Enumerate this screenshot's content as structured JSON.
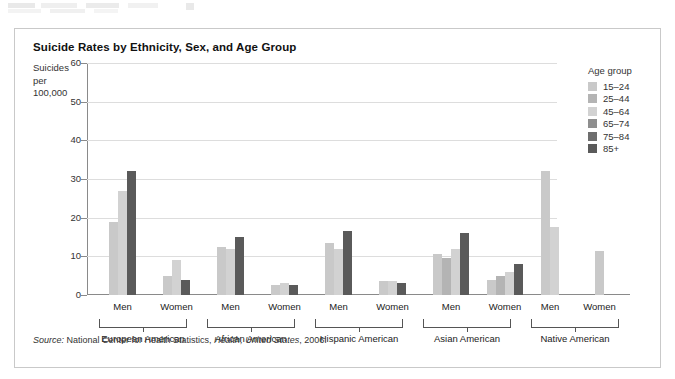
{
  "figure": {
    "title": "Suicide Rates by Ethnicity, Sex, and Age Group",
    "y_axis_label": "Suicides\nper\n100,000",
    "source": "Source: National Center for Health Statistics, Health, United States, 2006.",
    "source_prefix": "Source:",
    "source_middle": " National Center for Health Statistics, ",
    "source_italic": "Health, United States",
    "source_suffix": ", 2006."
  },
  "legend": {
    "title": "Age group",
    "items": [
      {
        "label": "15–24",
        "color": "#c9c9c9"
      },
      {
        "label": "25–44",
        "color": "#b4b4b4"
      },
      {
        "label": "45–64",
        "color": "#d2d2d2"
      },
      {
        "label": "65–74",
        "color": "#8e8e8e"
      },
      {
        "label": "75–84",
        "color": "#6e6e6e"
      },
      {
        "label": "85+",
        "color": "#5a5a5a"
      }
    ]
  },
  "chart_data": {
    "type": "bar",
    "title": "Suicide Rates by Ethnicity, Sex, and Age Group",
    "xlabel": "",
    "ylabel": "Suicides per 100,000",
    "ylim": [
      0,
      60
    ],
    "yticks": [
      0,
      10,
      20,
      30,
      40,
      50,
      60
    ],
    "ytick_labels": [
      "0",
      "10",
      "20",
      "30",
      "40",
      "50",
      "60"
    ],
    "grid": true,
    "legend_position": "right",
    "legend_title": "Age group",
    "series": [
      {
        "name": "15–24",
        "color": "#c9c9c9"
      },
      {
        "name": "25–44",
        "color": "#b4b4b4"
      },
      {
        "name": "45–64",
        "color": "#d2d2d2"
      },
      {
        "name": "65–74",
        "color": "#8e8e8e"
      },
      {
        "name": "75–84",
        "color": "#6e6e6e"
      },
      {
        "name": "85+",
        "color": "#5a5a5a"
      }
    ],
    "groups": [
      {
        "ethnicity": "European American",
        "sexes": [
          {
            "sex": "Men",
            "bars": [
              {
                "age": "15–24",
                "value": 19
              },
              {
                "age": "45–64",
                "value": 27
              },
              {
                "age": "85+",
                "value": 32
              }
            ]
          },
          {
            "sex": "Women",
            "bars": [
              {
                "age": "15–24",
                "value": 5
              },
              {
                "age": "45–64",
                "value": 9
              },
              {
                "age": "85+",
                "value": 4
              }
            ]
          }
        ]
      },
      {
        "ethnicity": "African American",
        "sexes": [
          {
            "sex": "Men",
            "bars": [
              {
                "age": "15–24",
                "value": 12.5
              },
              {
                "age": "45–64",
                "value": 12
              },
              {
                "age": "85+",
                "value": 15
              }
            ]
          },
          {
            "sex": "Women",
            "bars": [
              {
                "age": "15–24",
                "value": 2.5
              },
              {
                "age": "45–64",
                "value": 3
              },
              {
                "age": "85+",
                "value": 2.5
              }
            ]
          }
        ]
      },
      {
        "ethnicity": "Hispanic American",
        "sexes": [
          {
            "sex": "Men",
            "bars": [
              {
                "age": "15–24",
                "value": 13.5
              },
              {
                "age": "45–64",
                "value": 12
              },
              {
                "age": "85+",
                "value": 16.5
              }
            ]
          },
          {
            "sex": "Women",
            "bars": [
              {
                "age": "15–24",
                "value": 3.5
              },
              {
                "age": "45–64",
                "value": 3.5
              },
              {
                "age": "85+",
                "value": 3
              }
            ]
          }
        ]
      },
      {
        "ethnicity": "Asian American",
        "sexes": [
          {
            "sex": "Men",
            "bars": [
              {
                "age": "15–24",
                "value": 10.5
              },
              {
                "age": "25–44",
                "value": 9.5
              },
              {
                "age": "45–64",
                "value": 12
              },
              {
                "age": "85+",
                "value": 16
              }
            ]
          },
          {
            "sex": "Women",
            "bars": [
              {
                "age": "15–24",
                "value": 4
              },
              {
                "age": "25–44",
                "value": 5
              },
              {
                "age": "45–64",
                "value": 6
              },
              {
                "age": "85+",
                "value": 8
              }
            ]
          }
        ]
      },
      {
        "ethnicity": "Native American",
        "sexes": [
          {
            "sex": "Men",
            "bars": [
              {
                "age": "15–24",
                "value": 32
              },
              {
                "age": "45–64",
                "value": 17.5
              }
            ]
          },
          {
            "sex": "Women",
            "bars": [
              {
                "age": "15–24",
                "value": 11.5
              }
            ]
          }
        ]
      }
    ]
  }
}
